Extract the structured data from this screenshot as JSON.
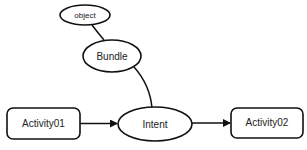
{
  "diagram": {
    "nodes": {
      "object": {
        "label": "object",
        "shape": "ellipse"
      },
      "bundle": {
        "label": "Bundle",
        "shape": "ellipse"
      },
      "intent": {
        "label": "Intent",
        "shape": "ellipse"
      },
      "activity01": {
        "label": "Activity01",
        "shape": "rounded-rect"
      },
      "activity02": {
        "label": "Activity02",
        "shape": "rounded-rect"
      }
    },
    "edges": [
      {
        "from": "object",
        "to": "bundle",
        "arrow": false
      },
      {
        "from": "bundle",
        "to": "intent",
        "arrow": false
      },
      {
        "from": "activity01",
        "to": "intent",
        "arrow": true
      },
      {
        "from": "intent",
        "to": "activity02",
        "arrow": true
      }
    ],
    "colors": {
      "stroke": "#111111",
      "background": "#ffffff",
      "text": "#222222"
    }
  }
}
